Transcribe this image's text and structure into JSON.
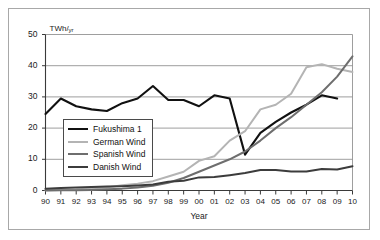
{
  "chart_data": {
    "type": "line",
    "title": "",
    "xlabel": "Year",
    "ylabel": "",
    "yunit": "TWh/",
    "yunit_sub": "yr",
    "xlim": [
      90,
      110
    ],
    "ylim": [
      0,
      50
    ],
    "yticks": [
      0,
      10,
      20,
      30,
      40,
      50
    ],
    "ytick_labels": [
      "0",
      "10",
      "20",
      "30",
      "40",
      "50"
    ],
    "grid": true,
    "grid_axis": "y",
    "legend_position": "left-lower",
    "x": [
      1990,
      1991,
      1992,
      1993,
      1994,
      1995,
      1996,
      1997,
      1998,
      1999,
      2000,
      2001,
      2002,
      2003,
      2004,
      2005,
      2006,
      2007,
      2008,
      2009,
      2010
    ],
    "xtick_labels": [
      "90",
      "91",
      "92",
      "93",
      "94",
      "95",
      "96",
      "97",
      "98",
      "99",
      "00",
      "01",
      "02",
      "03",
      "04",
      "05",
      "06",
      "07",
      "08",
      "09",
      "10"
    ],
    "series": [
      {
        "name": "Fukushima 1",
        "color": "#111111",
        "width": 2.1,
        "values": [
          24.5,
          29.5,
          27.0,
          26.0,
          25.5,
          28.0,
          29.5,
          33.5,
          29.0,
          29.0,
          27.0,
          30.5,
          29.5,
          11.5,
          18.5,
          22.0,
          25.0,
          27.5,
          30.5,
          29.5,
          null
        ]
      },
      {
        "name": "German Wind",
        "color": "#b4b4b4",
        "width": 2.0,
        "values": [
          0.1,
          0.2,
          0.3,
          0.7,
          1.0,
          1.7,
          2.2,
          3.0,
          4.5,
          6.0,
          9.5,
          11.0,
          16.0,
          19.0,
          26.0,
          27.5,
          31.0,
          39.5,
          40.5,
          39.0,
          38.0
        ]
      },
      {
        "name": "Spanish Wind",
        "color": "#6e6e6e",
        "width": 2.0,
        "values": [
          0.0,
          0.1,
          0.1,
          0.2,
          0.4,
          0.6,
          1.0,
          1.5,
          2.5,
          4.0,
          6.0,
          8.0,
          10.0,
          12.5,
          16.0,
          20.0,
          23.5,
          27.5,
          31.5,
          36.5,
          43.0
        ]
      },
      {
        "name": "Danish Wind",
        "color": "#3c3c3c",
        "width": 2.0,
        "values": [
          0.6,
          0.8,
          1.0,
          1.1,
          1.3,
          1.4,
          1.6,
          1.9,
          2.8,
          3.1,
          4.2,
          4.3,
          4.9,
          5.6,
          6.6,
          6.6,
          6.1,
          6.1,
          6.9,
          6.7,
          7.8
        ]
      }
    ]
  },
  "legend": {
    "items": [
      {
        "label": "Fukushima 1",
        "color": "#111111"
      },
      {
        "label": "German Wind",
        "color": "#b4b4b4"
      },
      {
        "label": "Spanish Wind",
        "color": "#6e6e6e"
      },
      {
        "label": "Danish Wind",
        "color": "#3c3c3c"
      }
    ]
  }
}
